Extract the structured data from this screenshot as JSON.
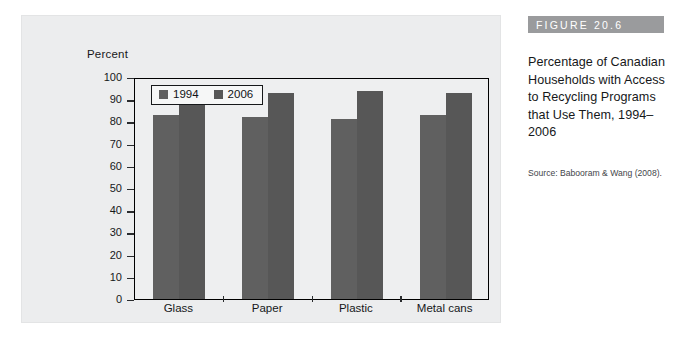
{
  "figure": {
    "banner_label": "FIGURE 20.6",
    "caption": "Percentage of Canadian Households with Access to Recycling Programs that Use Them, 1994–2006",
    "source": "Source: Babooram & Wang (2008)."
  },
  "chart_data": {
    "type": "bar",
    "title": "",
    "xlabel": "",
    "ylabel": "Percent",
    "categories": [
      "Glass",
      "Paper",
      "Plastic",
      "Metal cans"
    ],
    "series": [
      {
        "name": "1994",
        "values": [
          84,
          83,
          82,
          84
        ],
        "color": "#606060"
      },
      {
        "name": "2006",
        "values": [
          94,
          94,
          95,
          94
        ],
        "color": "#575757"
      }
    ],
    "ylim": [
      0,
      100
    ],
    "ytick_step": 10,
    "yticks": [
      0,
      10,
      20,
      30,
      40,
      50,
      60,
      70,
      80,
      90,
      100
    ],
    "grid": false,
    "legend_position": "top-left-inside"
  },
  "colors": {
    "card_background": "#ecedee",
    "plot_background": "#eeeff0",
    "axis": "#000000",
    "banner": "#9a9b9d",
    "banner_text": "#ffffff",
    "text": "#16181a"
  }
}
